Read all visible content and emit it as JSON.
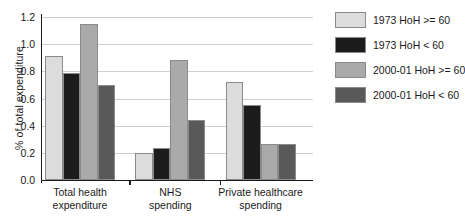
{
  "chart_data": {
    "type": "bar",
    "title": "",
    "xlabel": "",
    "ylabel": "% of total expenditure",
    "ylim": [
      0.0,
      1.2
    ],
    "ytick_labels": [
      "1.2",
      "1.0",
      "0.8",
      "0.6",
      "0.4",
      "0.2",
      "0.0"
    ],
    "ytick_values": [
      1.2,
      1.0,
      0.8,
      0.6,
      0.4,
      0.2,
      0.0
    ],
    "grid": "horizontal",
    "legend_position": "right",
    "categories": [
      "Total health\nexpenditure",
      "NHS\nspending",
      "Private healthcare\nspending"
    ],
    "series": [
      {
        "name": "1973 HoH >= 60",
        "color": "#dcdcdc",
        "values": [
          0.91,
          0.2,
          0.725
        ]
      },
      {
        "name": "1973 HoH < 60",
        "color": "#1c1c1c",
        "values": [
          0.79,
          0.235,
          0.555
        ]
      },
      {
        "name": "2000-01 HoH >= 60",
        "color": "#aaaaaa",
        "values": [
          1.15,
          0.885,
          0.265
        ]
      },
      {
        "name": "2000-01 HoH < 60",
        "color": "#595959",
        "values": [
          0.7,
          0.445,
          0.265
        ]
      }
    ]
  },
  "legend": {
    "items": [
      {
        "label": "1973 HoH >= 60"
      },
      {
        "label": "1973 HoH < 60"
      },
      {
        "label": "2000-01 HoH >= 60"
      },
      {
        "label": "2000-01 HoH < 60"
      }
    ]
  }
}
